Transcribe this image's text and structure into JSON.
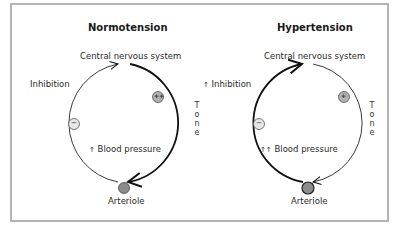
{
  "panels": [
    {
      "title": "Normotension",
      "cns_label": "Central nervous system",
      "inhibition_label": "Inhibition",
      "inhibition_arrows": "",
      "blood_pressure_label": "Blood pressure",
      "blood_pressure_arrows": "↑",
      "tone_label": [
        "T",
        "o",
        "n",
        "e"
      ],
      "arteriole_label": "Arteriole",
      "tone_sign": "++",
      "inhibition_sign": "−",
      "emphasis": "tone"
    },
    {
      "title": "Hypertension",
      "cns_label": "Central nervous system",
      "inhibition_label": "Inhibition",
      "inhibition_arrows": "↑",
      "blood_pressure_label": "Blood pressure",
      "blood_pressure_arrows": "↑↑",
      "tone_label": [
        "T",
        "o",
        "n",
        "e"
      ],
      "arteriole_label": "Arteriole",
      "tone_sign": "+",
      "inhibition_sign": "−",
      "emphasis": "inhibition"
    }
  ],
  "colors": {
    "frame": "#b4b4b4",
    "node_fill": "#8c8c8c",
    "sign_fill_strong": "#b0b0b0",
    "sign_fill_light": "#e6e6e6",
    "line": "#111111"
  }
}
